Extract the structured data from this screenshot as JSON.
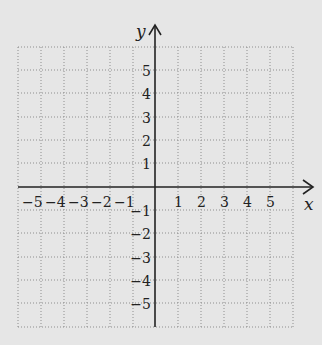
{
  "diagram": {
    "type": "coordinate-plane",
    "x_axis_label": "x",
    "y_axis_label": "y",
    "x_ticks": [
      "−5",
      "−4",
      "−3",
      "−2",
      "−1",
      "1",
      "2",
      "3",
      "4",
      "5"
    ],
    "y_ticks": [
      "5",
      "4",
      "3",
      "2",
      "1",
      "−1",
      "−2",
      "−3",
      "−4",
      "−5"
    ],
    "grid_range": {
      "x": [
        -6,
        6
      ],
      "y": [
        -6,
        6
      ]
    },
    "colors": {
      "background": "#e6e6e6",
      "grid": "#9a9a9a",
      "axis": "#222222"
    }
  }
}
